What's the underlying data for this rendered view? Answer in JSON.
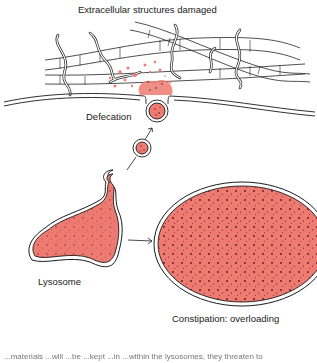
{
  "labels": {
    "title": "Extracellular structures damaged",
    "defecation": "Defecation",
    "lysosome": "Lysosome",
    "constipation": "Constipation: overloading"
  },
  "caption": "...materials ...will ...be ...kept ...in ...within the lysosomes, they threaten to",
  "colors": {
    "cytoplasm_fill": "#ee7b72",
    "outline": "#1a1a1a",
    "granule": "#5a1414",
    "background": "#ffffff"
  }
}
